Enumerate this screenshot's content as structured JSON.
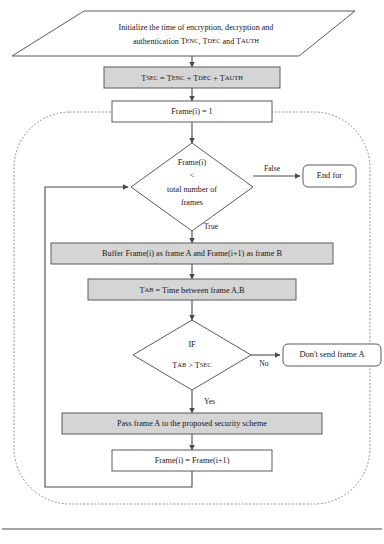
{
  "figure": {
    "type": "flowchart",
    "colors": {
      "process_fill": "#d5d5d5",
      "plain_fill": "#ffffff",
      "stroke": "#5a5a5a",
      "connector": "#4a4a4a",
      "boundary": "#8a8a8a",
      "text": "#161616"
    }
  },
  "nodes": {
    "init": {
      "shape": "parallelogram",
      "line1": "Initialize the time of encryption, decryption and",
      "line2_pre": "authentication T",
      "line2_sub1": "ENC",
      "line2_mid1": ", T",
      "line2_sub2": "DEC",
      "line2_mid2": " and T",
      "line2_sub3": "AUTH"
    },
    "tsec": {
      "shape": "process",
      "fill": "gray",
      "t_main": "T",
      "t_sub": "SEC",
      "eq": " = T",
      "sub_enc": "ENC",
      "plus1": " + T",
      "sub_dec": "DEC",
      "plus2": " + T",
      "sub_auth": "AUTH"
    },
    "frame_init": {
      "shape": "process",
      "fill": "white",
      "label": "Frame(i) = 1"
    },
    "decision_frames": {
      "shape": "decision",
      "line1": "Frame(i)",
      "line2": "<",
      "line3": "total number of",
      "line4": "frames"
    },
    "end_for": {
      "shape": "terminal",
      "label": "End for"
    },
    "buffer": {
      "shape": "process",
      "fill": "gray",
      "label": "Buffer Frame(i) as frame A and Frame(i+1) as frame B"
    },
    "tab": {
      "shape": "process",
      "fill": "gray",
      "t_main": "T",
      "t_sub": "AB",
      "rest": " = Time between frame A,B"
    },
    "decision_if": {
      "shape": "decision",
      "line1": "IF",
      "line2_t1": "T",
      "line2_s1": "AB",
      "line2_op": " > T",
      "line2_s2": "SEC"
    },
    "dont_send": {
      "shape": "terminal",
      "label": "Don't send frame A"
    },
    "pass_frame": {
      "shape": "process",
      "fill": "gray",
      "label": "Pass frame A to the proposed security scheme"
    },
    "frame_incr": {
      "shape": "process",
      "fill": "white",
      "label": "Frame(i) = Frame(i+1)"
    }
  },
  "edge_labels": {
    "false": "False",
    "true": "True",
    "no": "No",
    "yes": "Yes"
  }
}
